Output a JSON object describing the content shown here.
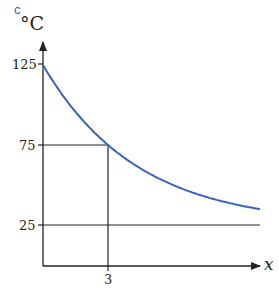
{
  "panel_label": "c",
  "colors": {
    "curve": "#3a62c0",
    "axes": "#222222"
  },
  "chart_data": {
    "type": "line",
    "title": "",
    "xlabel": "x",
    "ylabel": "°C",
    "yticks": [
      "125",
      "75",
      "25"
    ],
    "xticks": [
      "3"
    ],
    "series": [
      {
        "name": "temperature curve (exponential decay toward 25)",
        "x": [
          0,
          1,
          2,
          3,
          4,
          5,
          6,
          7,
          8,
          9,
          10
        ],
        "values": [
          125,
          104.4,
          88.0,
          75,
          64.7,
          56.5,
          50,
          44.8,
          40.7,
          37.5,
          34.8
        ]
      }
    ],
    "annotations": [
      {
        "type": "guide-lines",
        "description": "horizontal line at 75 from y-axis to x=3, vertical line at x=3 down to x-axis"
      },
      {
        "type": "asymptote",
        "value": 25,
        "description": "horizontal line at 25"
      }
    ],
    "xlim": [
      0,
      10.3
    ],
    "ylim": [
      0,
      140
    ],
    "grid": false
  }
}
